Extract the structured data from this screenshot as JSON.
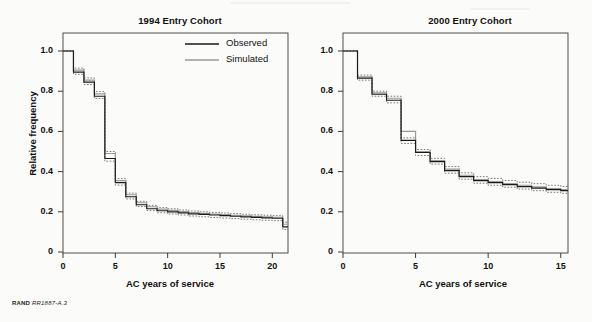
{
  "figure": {
    "footer_label": "RAND",
    "footer_code": "RR1887-A.3",
    "ylabel": "Relative frequency",
    "legend": {
      "position": "top-right-of-left-panel",
      "entries": [
        {
          "label": "Observed",
          "color": "#1a1a1a",
          "style": "solid"
        },
        {
          "label": "Simulated",
          "color": "#9a9a9a",
          "style": "solid"
        }
      ]
    }
  },
  "chart_data": [
    {
      "type": "line",
      "title": "1994 Entry Cohort",
      "xlabel": "AC years of service",
      "ylabel": "Relative frequency",
      "xlim": [
        0,
        21.5
      ],
      "ylim": [
        0,
        1.05
      ],
      "xticks": [
        0,
        5,
        10,
        15,
        20
      ],
      "xticklabels": [
        "0",
        "5",
        "10",
        "15",
        "20"
      ],
      "yticks": [
        0,
        0.2,
        0.4,
        0.6,
        0.8,
        1.0
      ],
      "yticklabels": [
        "0",
        "0.2",
        "0.4",
        "0.6",
        "0.8",
        "1.0"
      ],
      "grid": false,
      "drawstyle": "steps-post",
      "legend": [
        "Observed",
        "Simulated"
      ],
      "x": [
        0,
        1,
        2,
        3,
        4,
        5,
        6,
        7,
        8,
        9,
        10,
        11,
        12,
        13,
        14,
        15,
        16,
        17,
        18,
        19,
        20,
        21
      ],
      "series": [
        {
          "name": "Observed",
          "color": "#1a1a1a",
          "values": [
            1.0,
            0.895,
            0.845,
            0.775,
            0.465,
            0.345,
            0.275,
            0.235,
            0.215,
            0.205,
            0.2,
            0.195,
            0.19,
            0.187,
            0.184,
            0.181,
            0.178,
            0.175,
            0.172,
            0.17,
            0.168,
            0.125
          ]
        },
        {
          "name": "Simulated",
          "color": "#9a9a9a",
          "values": [
            1.0,
            0.905,
            0.855,
            0.787,
            0.49,
            0.355,
            0.285,
            0.245,
            0.225,
            0.213,
            0.207,
            0.201,
            0.196,
            0.192,
            0.189,
            0.186,
            0.183,
            0.18,
            0.177,
            0.175,
            0.173,
            0.138
          ]
        },
        {
          "name": "Simulated upper bound",
          "color": "#5a5a5a",
          "style": "dotted",
          "values": [
            1.0,
            0.915,
            0.866,
            0.798,
            0.5,
            0.365,
            0.293,
            0.252,
            0.232,
            0.221,
            0.215,
            0.209,
            0.204,
            0.2,
            0.197,
            0.194,
            0.191,
            0.188,
            0.185,
            0.183,
            0.181,
            0.148
          ]
        },
        {
          "name": "Simulated lower bound",
          "color": "#5a5a5a",
          "style": "dotted",
          "values": [
            1.0,
            0.884,
            0.833,
            0.764,
            0.452,
            0.333,
            0.264,
            0.226,
            0.206,
            0.195,
            0.189,
            0.184,
            0.179,
            0.175,
            0.172,
            0.169,
            0.166,
            0.163,
            0.16,
            0.158,
            0.156,
            0.112
          ]
        }
      ]
    },
    {
      "type": "line",
      "title": "2000 Entry Cohort",
      "xlabel": "AC years of service",
      "ylabel": "Relative frequency",
      "xlim": [
        0,
        15.5
      ],
      "ylim": [
        0,
        1.05
      ],
      "xticks": [
        0,
        5,
        10,
        15
      ],
      "xticklabels": [
        "0",
        "5",
        "10",
        "15"
      ],
      "yticks": [
        0,
        0.2,
        0.4,
        0.6,
        0.8,
        1.0
      ],
      "yticklabels": [
        "0",
        "0.2",
        "0.4",
        "0.6",
        "0.8",
        "1.0"
      ],
      "grid": false,
      "drawstyle": "steps-post",
      "legend": [
        "Observed",
        "Simulated"
      ],
      "x": [
        0,
        1,
        2,
        3,
        4,
        5,
        6,
        7,
        8,
        9,
        10,
        11,
        12,
        13,
        14,
        15
      ],
      "series": [
        {
          "name": "Observed",
          "color": "#1a1a1a",
          "values": [
            1.0,
            0.865,
            0.785,
            0.755,
            0.555,
            0.495,
            0.45,
            0.405,
            0.375,
            0.355,
            0.345,
            0.335,
            0.325,
            0.318,
            0.31,
            0.305
          ]
        },
        {
          "name": "Simulated",
          "color": "#9a9a9a",
          "values": [
            1.0,
            0.872,
            0.792,
            0.765,
            0.6,
            0.5,
            0.455,
            0.412,
            0.382,
            0.36,
            0.35,
            0.34,
            0.332,
            0.324,
            0.316,
            0.31
          ]
        },
        {
          "name": "Simulated upper bound",
          "color": "#5a5a5a",
          "style": "dotted",
          "values": [
            1.0,
            0.88,
            0.8,
            0.775,
            0.568,
            0.51,
            0.466,
            0.425,
            0.394,
            0.375,
            0.366,
            0.356,
            0.347,
            0.34,
            0.332,
            0.326
          ]
        },
        {
          "name": "Simulated lower bound",
          "color": "#5a5a5a",
          "style": "dotted",
          "values": [
            1.0,
            0.855,
            0.775,
            0.742,
            0.54,
            0.48,
            0.437,
            0.392,
            0.362,
            0.342,
            0.332,
            0.322,
            0.313,
            0.305,
            0.297,
            0.292
          ]
        }
      ]
    }
  ]
}
